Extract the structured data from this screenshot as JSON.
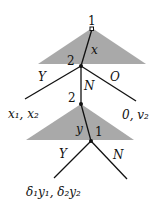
{
  "diagram": {
    "type": "game-tree",
    "nodes": {
      "root_player": "1",
      "second_player": "2",
      "third_label": "2",
      "final_player": "1"
    },
    "actions": {
      "offer_x": "x",
      "accept_1": "Y",
      "reject_1": "N",
      "outside": "O",
      "offer_y": "y",
      "accept_2": "Y",
      "reject_2": "N"
    },
    "payoffs": {
      "accept_first": "x₁, x₂",
      "outside_option": "0, v₂",
      "accept_second": "δ₁y₁, δ₂y₂"
    },
    "colors": {
      "triangle_fill": "#a9a9a9",
      "line": "#111111"
    }
  }
}
